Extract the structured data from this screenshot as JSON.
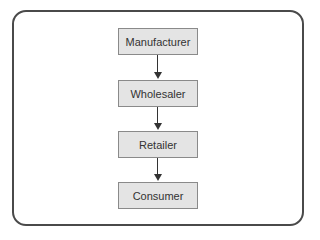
{
  "diagram": {
    "type": "flowchart",
    "direction": "top-to-bottom",
    "nodes": [
      {
        "id": "n1",
        "label": "Manufacturer"
      },
      {
        "id": "n2",
        "label": "Wholesaler"
      },
      {
        "id": "n3",
        "label": "Retailer"
      },
      {
        "id": "n4",
        "label": "Consumer"
      }
    ],
    "edges": [
      {
        "from": "n1",
        "to": "n2"
      },
      {
        "from": "n2",
        "to": "n3"
      },
      {
        "from": "n3",
        "to": "n4"
      }
    ]
  }
}
